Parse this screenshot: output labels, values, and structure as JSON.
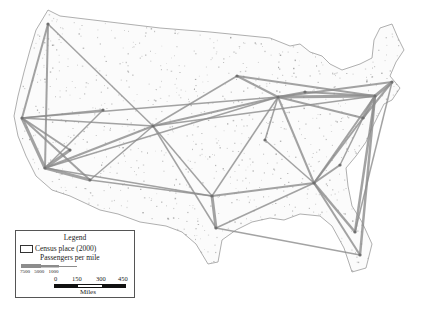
{
  "figure": {
    "colors": {
      "background": "#ffffff",
      "land_dots": "#9a9a9a",
      "outline": "#8a8a8a",
      "flow_lines": "#8c8c8c"
    }
  },
  "legend": {
    "title": "Legend",
    "census_label": "Census place (2000)",
    "passengers_label": "Passengers per mile",
    "passenger_breaks": [
      "7500",
      "5000",
      "1000"
    ],
    "scale_ticks": [
      "0",
      "150",
      "300",
      "450"
    ],
    "scale_unit": "Miles"
  },
  "hubs": [
    {
      "name": "Seattle",
      "x": 48,
      "y": 24
    },
    {
      "name": "San Francisco",
      "x": 22,
      "y": 118
    },
    {
      "name": "Los Angeles",
      "x": 45,
      "y": 168
    },
    {
      "name": "Las Vegas",
      "x": 70,
      "y": 150
    },
    {
      "name": "Phoenix",
      "x": 90,
      "y": 180
    },
    {
      "name": "Salt Lake City",
      "x": 103,
      "y": 110
    },
    {
      "name": "Denver",
      "x": 153,
      "y": 126
    },
    {
      "name": "Minneapolis",
      "x": 237,
      "y": 76
    },
    {
      "name": "Chicago",
      "x": 278,
      "y": 97
    },
    {
      "name": "Detroit",
      "x": 305,
      "y": 92
    },
    {
      "name": "New York",
      "x": 375,
      "y": 96
    },
    {
      "name": "Boston",
      "x": 392,
      "y": 82
    },
    {
      "name": "Washington",
      "x": 363,
      "y": 118
    },
    {
      "name": "Dallas",
      "x": 212,
      "y": 196
    },
    {
      "name": "Houston",
      "x": 216,
      "y": 228
    },
    {
      "name": "Atlanta",
      "x": 314,
      "y": 183
    },
    {
      "name": "Charlotte",
      "x": 340,
      "y": 165
    },
    {
      "name": "Orlando",
      "x": 355,
      "y": 232
    },
    {
      "name": "Miami",
      "x": 360,
      "y": 255
    },
    {
      "name": "St. Louis",
      "x": 265,
      "y": 140
    }
  ],
  "routes": [
    [
      "Seattle",
      "San Francisco",
      2
    ],
    [
      "Seattle",
      "Los Angeles",
      2
    ],
    [
      "Seattle",
      "Denver",
      1.5
    ],
    [
      "San Francisco",
      "Los Angeles",
      3
    ],
    [
      "San Francisco",
      "Las Vegas",
      2
    ],
    [
      "San Francisco",
      "Phoenix",
      2
    ],
    [
      "San Francisco",
      "Salt Lake City",
      1.5
    ],
    [
      "San Francisco",
      "Denver",
      1.5
    ],
    [
      "San Francisco",
      "Chicago",
      1.5
    ],
    [
      "Los Angeles",
      "Las Vegas",
      3
    ],
    [
      "Los Angeles",
      "Phoenix",
      3
    ],
    [
      "Los Angeles",
      "Salt Lake City",
      1.5
    ],
    [
      "Los Angeles",
      "Denver",
      2
    ],
    [
      "Los Angeles",
      "Dallas",
      1.5
    ],
    [
      "Los Angeles",
      "Chicago",
      1.5
    ],
    [
      "Phoenix",
      "Denver",
      1.5
    ],
    [
      "Phoenix",
      "Dallas",
      1.5
    ],
    [
      "Denver",
      "Chicago",
      2
    ],
    [
      "Denver",
      "Minneapolis",
      1.5
    ],
    [
      "Denver",
      "Dallas",
      1.5
    ],
    [
      "Denver",
      "Houston",
      1.5
    ],
    [
      "Denver",
      "New York",
      1.5
    ],
    [
      "Minneapolis",
      "Chicago",
      2
    ],
    [
      "Minneapolis",
      "New York",
      2
    ],
    [
      "Chicago",
      "New York",
      3
    ],
    [
      "Chicago",
      "Boston",
      2
    ],
    [
      "Chicago",
      "Washington",
      2
    ],
    [
      "Chicago",
      "Atlanta",
      2
    ],
    [
      "Chicago",
      "Dallas",
      1.5
    ],
    [
      "Chicago",
      "St. Louis",
      1.5
    ],
    [
      "Chicago",
      "Detroit",
      2
    ],
    [
      "Detroit",
      "New York",
      2
    ],
    [
      "New York",
      "Boston",
      3
    ],
    [
      "New York",
      "Washington",
      3
    ],
    [
      "New York",
      "Atlanta",
      2
    ],
    [
      "New York",
      "Orlando",
      2.5
    ],
    [
      "New York",
      "Miami",
      2.5
    ],
    [
      "Boston",
      "Washington",
      2
    ],
    [
      "Boston",
      "Orlando",
      1.5
    ],
    [
      "Washington",
      "Atlanta",
      2
    ],
    [
      "Washington",
      "Charlotte",
      1.5
    ],
    [
      "Atlanta",
      "Dallas",
      2
    ],
    [
      "Atlanta",
      "Houston",
      1.5
    ],
    [
      "Atlanta",
      "Orlando",
      2.5
    ],
    [
      "Atlanta",
      "Miami",
      2
    ],
    [
      "Atlanta",
      "Charlotte",
      2
    ],
    [
      "Atlanta",
      "St. Louis",
      1.5
    ],
    [
      "Dallas",
      "Houston",
      3
    ],
    [
      "Houston",
      "Miami",
      1.5
    ]
  ]
}
